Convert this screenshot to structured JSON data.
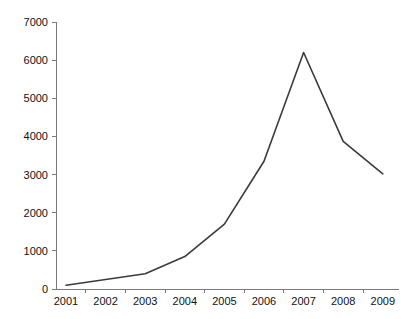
{
  "chart_data": {
    "type": "line",
    "title": "",
    "subtitle": "",
    "xlabel": "",
    "ylabel": "",
    "categories": [
      "2001",
      "2002",
      "2003",
      "2004",
      "2005",
      "2006",
      "2007",
      "2008",
      "2009"
    ],
    "values": [
      100,
      250,
      400,
      850,
      1700,
      3350,
      6200,
      3870,
      3020
    ],
    "series": [
      {
        "name": "",
        "values": [
          100,
          250,
          400,
          850,
          1700,
          3350,
          6200,
          3870,
          3020
        ]
      }
    ],
    "ylim": [
      0,
      7000
    ],
    "ytick_labels": [
      "0",
      "1000",
      "2000",
      "3000",
      "4000",
      "5000",
      "6000",
      "7000"
    ],
    "ytick_values": [
      0,
      1000,
      2000,
      3000,
      4000,
      5000,
      6000,
      7000
    ],
    "xtick_labels": [
      "2001",
      "2002",
      "2003",
      "2004",
      "2005",
      "2006",
      "2007",
      "2008",
      "2009"
    ],
    "grid": false,
    "legend": false,
    "legend_position": "none",
    "annotations": [],
    "colors": {
      "line": "#3b3b3b",
      "axis": "#7a7a7a",
      "text": "#111111",
      "background": "#ffffff"
    }
  },
  "plot_geometry": {
    "left": 56,
    "right": 399,
    "top": 22,
    "bottom": 289,
    "first_point_x": 66,
    "point_spacing": 39.6
  }
}
